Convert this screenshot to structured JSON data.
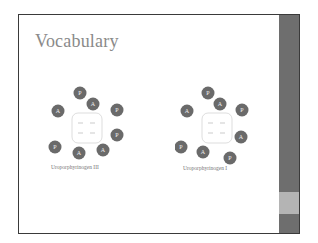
{
  "slide": {
    "title": "Vocabulary",
    "diagrams": [
      {
        "caption": "Uroporphyrinogen III",
        "substituents": [
          {
            "label": "P",
            "cx": 35,
            "cy": 10
          },
          {
            "label": "A",
            "cx": 13,
            "cy": 28
          },
          {
            "label": "A",
            "cx": 48,
            "cy": 21
          },
          {
            "label": "P",
            "cx": 72,
            "cy": 27
          },
          {
            "label": "P",
            "cx": 72,
            "cy": 52
          },
          {
            "label": "P",
            "cx": 10,
            "cy": 64
          },
          {
            "label": "A",
            "cx": 34,
            "cy": 70
          },
          {
            "label": "A",
            "cx": 58,
            "cy": 67
          }
        ]
      },
      {
        "caption": "Uroporphyrinogen I",
        "substituents": [
          {
            "label": "P",
            "cx": 33,
            "cy": 10
          },
          {
            "label": "A",
            "cx": 12,
            "cy": 28
          },
          {
            "label": "A",
            "cx": 45,
            "cy": 21
          },
          {
            "label": "P",
            "cx": 67,
            "cy": 27
          },
          {
            "label": "A",
            "cx": 66,
            "cy": 54
          },
          {
            "label": "P",
            "cx": 6,
            "cy": 64
          },
          {
            "label": "A",
            "cx": 28,
            "cy": 69
          },
          {
            "label": "P",
            "cx": 55,
            "cy": 75
          }
        ]
      }
    ]
  },
  "colors": {
    "circle": "#6a6a6a",
    "title": "#8a8a8a",
    "sidebar": "#6e6e6e",
    "sidebar_band": "#b4b4b4"
  }
}
